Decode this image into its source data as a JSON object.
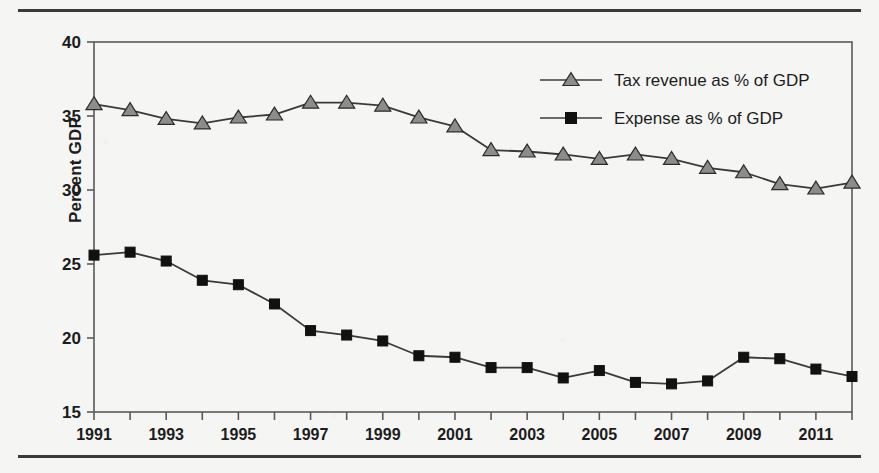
{
  "chart_data": {
    "type": "line",
    "title": "",
    "xlabel": "",
    "ylabel": "Percent GDP",
    "xlim": [
      1991,
      2012
    ],
    "ylim": [
      15,
      40
    ],
    "yticks": [
      15,
      20,
      25,
      30,
      35,
      40
    ],
    "ytick_labels": [
      "15",
      "20",
      "25",
      "30",
      "35",
      "40"
    ],
    "x": [
      1991,
      1992,
      1993,
      1994,
      1995,
      1996,
      1997,
      1998,
      1999,
      2000,
      2001,
      2002,
      2003,
      2004,
      2005,
      2006,
      2007,
      2008,
      2009,
      2010,
      2011,
      2012
    ],
    "xtick_labels": [
      "1991",
      "",
      "1993",
      "",
      "1995",
      "",
      "1997",
      "",
      "1999",
      "",
      "2001",
      "",
      "2003",
      "",
      "2005",
      "",
      "2007",
      "",
      "2009",
      "",
      "2011",
      ""
    ],
    "grid": false,
    "legend_position": "top-right",
    "series": [
      {
        "name": "Tax revenue as % of GDP",
        "marker": "triangle",
        "marker_color": "#8c8c8c",
        "line_color": "#3a3a3a",
        "values": [
          35.8,
          35.4,
          34.8,
          34.5,
          34.9,
          35.1,
          35.9,
          35.9,
          35.7,
          34.9,
          34.3,
          32.7,
          32.6,
          32.4,
          32.1,
          32.4,
          32.1,
          31.5,
          31.2,
          30.4,
          30.1,
          30.5
        ]
      },
      {
        "name": "Expense as % of GDP",
        "marker": "square",
        "marker_color": "#111111",
        "line_color": "#3a3a3a",
        "values": [
          25.6,
          25.8,
          25.2,
          23.9,
          23.6,
          22.3,
          20.5,
          20.2,
          19.8,
          18.8,
          18.7,
          18.0,
          18.0,
          17.3,
          17.8,
          17.0,
          16.9,
          17.1,
          18.7,
          18.6,
          17.9,
          17.4
        ]
      }
    ]
  },
  "legend": {
    "items": [
      {
        "label": "Tax revenue as % of GDP",
        "marker": "triangle-marker",
        "color": "#8c8c8c"
      },
      {
        "label": "Expense as % of GDP",
        "marker": "square-marker",
        "color": "#111111"
      }
    ]
  },
  "axis": {
    "y_title": "Percent GDP"
  }
}
